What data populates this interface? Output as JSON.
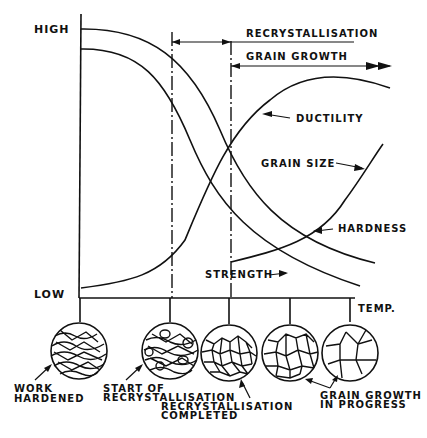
{
  "diagram": {
    "type": "annealing-properties-vs-temperature",
    "y_axis": {
      "high_label": "HIGH",
      "low_label": "LOW"
    },
    "x_axis": {
      "label": "TEMP."
    },
    "stages_top": {
      "recrystallisation": "RECRYSTALLISATION",
      "grain_growth": "GRAIN GROWTH"
    },
    "curves": [
      {
        "name": "ductility",
        "label": "DUCTILITY"
      },
      {
        "name": "grain-size",
        "label": "GRAIN SIZE"
      },
      {
        "name": "hardness",
        "label": "HARDNESS"
      },
      {
        "name": "strength",
        "label": "STRENGTH"
      }
    ],
    "microstructures": [
      {
        "name": "work-hardened",
        "label_lines": [
          "WORK",
          "HARDENED"
        ]
      },
      {
        "name": "start-of-recrystallisation",
        "label_lines": [
          "START OF",
          "RECRYSTALLISATION"
        ]
      },
      {
        "name": "recrystallisation-completed",
        "label_lines": [
          "RECRYSTALLISATION",
          "COMPLETED"
        ]
      },
      {
        "name": "grain-growth-1",
        "label_lines": []
      },
      {
        "name": "grain-growth-2",
        "label_lines": [
          "GRAIN GROWTH",
          "IN PROGRESS"
        ]
      }
    ]
  }
}
